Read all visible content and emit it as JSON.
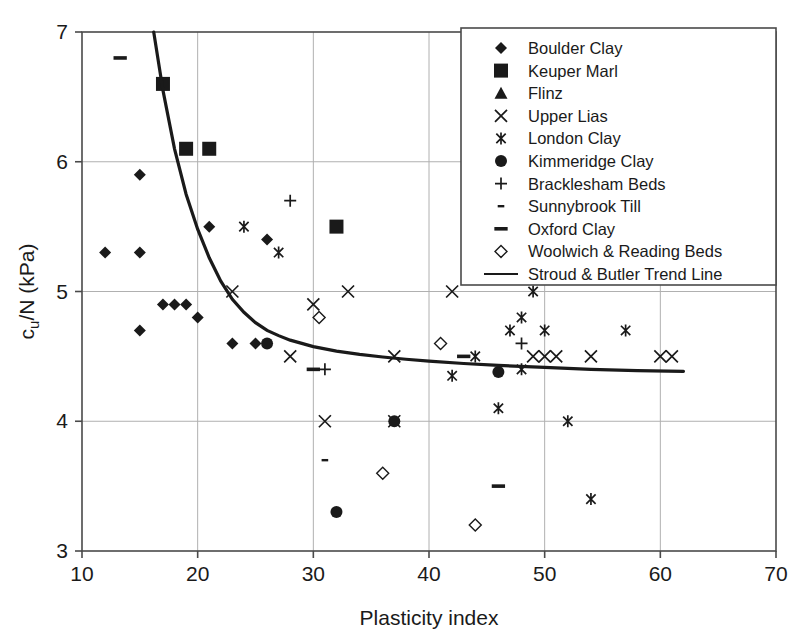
{
  "chart_data": {
    "type": "scatter",
    "title": "",
    "xlabel": "Plasticity index",
    "ylabel": "c u /N (kPa)",
    "ylabel_main": "c",
    "ylabel_sub": "u",
    "ylabel_rest": "/N (kPa)",
    "xlim": [
      10,
      70
    ],
    "ylim": [
      3,
      7
    ],
    "xticks": [
      10,
      20,
      30,
      40,
      50,
      60,
      70
    ],
    "yticks": [
      3,
      4,
      5,
      6,
      7
    ],
    "xtick_labels": [
      "10",
      "20",
      "30",
      "40",
      "50",
      "60",
      "70"
    ],
    "ytick_labels": [
      "3",
      "4",
      "5",
      "6",
      "7"
    ],
    "grid": true,
    "grid_color": "#b0b0b0",
    "axis_color": "#4a4a4a",
    "marker_color": "#1a1a1a",
    "legend_position": "top-right",
    "series": [
      {
        "name": "Boulder Clay",
        "marker": "diamond",
        "points": [
          [
            12,
            5.3
          ],
          [
            15,
            5.3
          ],
          [
            15,
            5.9
          ],
          [
            15,
            4.7
          ],
          [
            17,
            4.9
          ],
          [
            18,
            4.9
          ],
          [
            19,
            4.9
          ],
          [
            20,
            4.8
          ],
          [
            21,
            5.5
          ],
          [
            23,
            4.6
          ],
          [
            25,
            4.6
          ],
          [
            26,
            5.4
          ]
        ]
      },
      {
        "name": "Keuper Marl",
        "marker": "square",
        "points": [
          [
            17,
            6.6
          ],
          [
            19,
            6.1
          ],
          [
            21,
            6.1
          ],
          [
            32,
            5.5
          ]
        ]
      },
      {
        "name": "Flinz",
        "marker": "triangle",
        "points": []
      },
      {
        "name": "Upper Lias",
        "marker": "cross-x",
        "points": [
          [
            23,
            5.0
          ],
          [
            28,
            4.5
          ],
          [
            30,
            4.9
          ],
          [
            31,
            4.0
          ],
          [
            33,
            5.0
          ],
          [
            37,
            4.0
          ],
          [
            37,
            4.5
          ],
          [
            42,
            5.0
          ],
          [
            49,
            4.5
          ],
          [
            50,
            4.5
          ],
          [
            51,
            4.5
          ],
          [
            54,
            4.5
          ],
          [
            60,
            4.5
          ],
          [
            61,
            4.5
          ]
        ]
      },
      {
        "name": "London Clay",
        "marker": "asterisk",
        "points": [
          [
            24,
            5.5
          ],
          [
            27,
            5.3
          ],
          [
            42,
            4.35
          ],
          [
            44,
            4.5
          ],
          [
            46,
            4.1
          ],
          [
            47,
            4.7
          ],
          [
            48,
            4.8
          ],
          [
            48,
            4.4
          ],
          [
            49,
            5.0
          ],
          [
            50,
            4.7
          ],
          [
            52,
            4.0
          ],
          [
            54,
            3.4
          ],
          [
            57,
            4.7
          ]
        ]
      },
      {
        "name": "Kimmeridge Clay",
        "marker": "circle",
        "points": [
          [
            26,
            4.6
          ],
          [
            32,
            3.3
          ],
          [
            37,
            4.0
          ],
          [
            46,
            4.38
          ]
        ]
      },
      {
        "name": "Bracklesham Beds",
        "marker": "plus",
        "points": [
          [
            28,
            5.7
          ],
          [
            31,
            4.4
          ],
          [
            48,
            4.6
          ]
        ]
      },
      {
        "name": "Sunnybrook Till",
        "marker": "dash-small",
        "points": [
          [
            31,
            3.7
          ]
        ]
      },
      {
        "name": "Oxford Clay",
        "marker": "dash-wide",
        "points": [
          [
            13.3,
            6.8
          ],
          [
            30,
            4.4
          ],
          [
            43,
            4.5
          ],
          [
            46,
            3.5
          ]
        ]
      },
      {
        "name": "Woolwich & Reading Beds",
        "marker": "open-diamond",
        "points": [
          [
            30.5,
            4.8
          ],
          [
            36,
            3.6
          ],
          [
            41,
            4.6
          ],
          [
            44,
            3.2
          ]
        ]
      },
      {
        "name": "Stroud & Butler Trend Line",
        "marker": "line",
        "trend_line": [
          [
            16.2,
            7.0
          ],
          [
            17,
            6.55
          ],
          [
            18,
            6.1
          ],
          [
            19,
            5.75
          ],
          [
            20,
            5.48
          ],
          [
            21,
            5.26
          ],
          [
            22,
            5.08
          ],
          [
            23,
            4.94
          ],
          [
            24,
            4.84
          ],
          [
            25,
            4.76
          ],
          [
            26,
            4.7
          ],
          [
            27,
            4.66
          ],
          [
            28,
            4.625
          ],
          [
            30,
            4.575
          ],
          [
            32,
            4.54
          ],
          [
            34,
            4.515
          ],
          [
            36,
            4.495
          ],
          [
            38,
            4.478
          ],
          [
            40,
            4.463
          ],
          [
            43,
            4.445
          ],
          [
            46,
            4.43
          ],
          [
            50,
            4.415
          ],
          [
            54,
            4.4
          ],
          [
            58,
            4.39
          ],
          [
            62,
            4.385
          ]
        ]
      }
    ]
  },
  "legend": {
    "items": [
      {
        "label": "Boulder Clay",
        "marker": "diamond"
      },
      {
        "label": "Keuper Marl",
        "marker": "square"
      },
      {
        "label": "Flinz",
        "marker": "triangle"
      },
      {
        "label": "Upper Lias",
        "marker": "cross-x"
      },
      {
        "label": "London Clay",
        "marker": "asterisk"
      },
      {
        "label": "Kimmeridge Clay",
        "marker": "circle"
      },
      {
        "label": "Bracklesham Beds",
        "marker": "plus"
      },
      {
        "label": "Sunnybrook Till",
        "marker": "dash-small"
      },
      {
        "label": "Oxford Clay",
        "marker": "dash-wide"
      },
      {
        "label": "Woolwich & Reading Beds",
        "marker": "open-diamond"
      },
      {
        "label": "Stroud & Butler Trend Line",
        "marker": "line"
      }
    ]
  }
}
